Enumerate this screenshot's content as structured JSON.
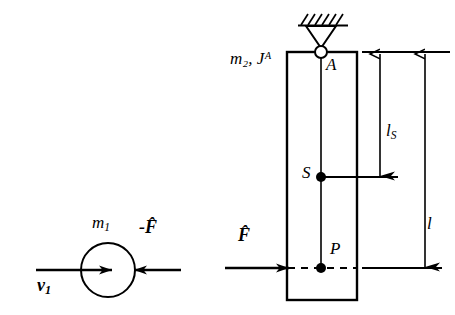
{
  "figure": {
    "background_color": "#ffffff",
    "stroke_color": "#000000",
    "width": 455,
    "height": 315
  },
  "left_body": {
    "name": "impacting-mass",
    "shape": "circle",
    "mass_label": "m",
    "mass_subscript": "1",
    "velocity_label": "v",
    "velocity_subscript": "1",
    "reaction_impulse_label": "-F̂",
    "circle": {
      "cx": 108,
      "cy": 270,
      "r": 27
    },
    "velocity_arrow": {
      "x1": 36,
      "y1": 270,
      "x2": 112,
      "y2": 270,
      "direction": "right"
    },
    "reaction_arrow": {
      "x1": 181,
      "y1": 270,
      "x2": 134,
      "y2": 270,
      "direction": "left"
    }
  },
  "right_body": {
    "name": "pinned-bar",
    "shape": "rectangle",
    "mass_label": "m",
    "mass_subscript": "2",
    "inertia_label": "J",
    "inertia_superscript": "A",
    "combined_label": "m₂, Jᴬ",
    "rect": {
      "x": 287,
      "y": 52,
      "width": 70,
      "height": 248
    },
    "centerline_x": 321,
    "pivot_label": "A",
    "pivot": {
      "cx": 321,
      "cy": 52,
      "r": 6
    },
    "support_type": "pin-support-hatched",
    "ground_line": {
      "x1": 298,
      "y1": 25,
      "x2": 348,
      "y2": 25
    },
    "center_of_mass_label": "S",
    "center_of_mass": {
      "cx": 321,
      "cy": 177,
      "r": 5
    },
    "impact_point_label": "P",
    "impact_point": {
      "cx": 321,
      "cy": 268,
      "r": 5
    },
    "impulse_label": "F̂",
    "impulse_arrow": {
      "x1": 225,
      "y1": 268,
      "x2": 288,
      "y2": 268,
      "direction": "right"
    }
  },
  "dimensions": [
    {
      "name": "distance-to-center-of-mass",
      "label": "l",
      "subscript": "S",
      "from": "A",
      "to": "S",
      "x": 380,
      "y_top": 52,
      "y_bottom": 177
    },
    {
      "name": "distance-to-impact-point",
      "label": "l",
      "subscript": "",
      "from": "A",
      "to": "P",
      "x": 425,
      "y_top": 52,
      "y_bottom": 268
    }
  ],
  "reference_lines": {
    "top": {
      "x1": 362,
      "y1": 52,
      "x2": 450,
      "y2": 52
    },
    "at_S": {
      "x1": 325,
      "y1": 177,
      "x2": 398,
      "y2": 177
    },
    "at_P": {
      "x1": 362,
      "y1": 268,
      "x2": 442,
      "y2": 268
    },
    "dashed_through_P": {
      "x1": 288,
      "y1": 268,
      "x2": 357,
      "y2": 268,
      "style": "dashed"
    }
  }
}
